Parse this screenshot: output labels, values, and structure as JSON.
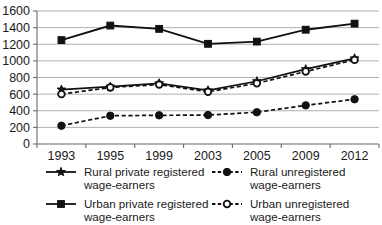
{
  "chart_data": {
    "type": "line",
    "title": "",
    "subtitle": "",
    "xlabel": "",
    "ylabel": "",
    "categories": [
      "1993",
      "1995",
      "1999",
      "2003",
      "2005",
      "2009",
      "2012"
    ],
    "x_tick_labels": [
      "1993",
      "1995",
      "1999",
      "2003",
      "2005",
      "2009",
      "2012"
    ],
    "y_tick_labels": [
      "0",
      "200",
      "400",
      "600",
      "800",
      "1000",
      "1200",
      "1400",
      "1600"
    ],
    "y_ticks": [
      0,
      200,
      400,
      600,
      800,
      1000,
      1200,
      1400,
      1600
    ],
    "ylim": [
      0,
      1600
    ],
    "grid": "horizontal",
    "legend_position": "bottom",
    "series": [
      {
        "name": "Rural private registered wage-earners",
        "line_style": "solid",
        "marker": "star",
        "color": "#111111",
        "values": [
          655,
          690,
          730,
          645,
          755,
          900,
          1030
        ]
      },
      {
        "name": "Rural unregistered wage-earners",
        "line_style": "dashed",
        "marker": "circle-filled",
        "color": "#111111",
        "values": [
          220,
          340,
          345,
          348,
          382,
          465,
          538
        ]
      },
      {
        "name": "Urban private registered wage-earners",
        "line_style": "solid",
        "marker": "square-filled",
        "color": "#111111",
        "values": [
          1250,
          1425,
          1385,
          1205,
          1232,
          1375,
          1448
        ]
      },
      {
        "name": "Urban unregistered wage-earners",
        "line_style": "dashed",
        "marker": "circle-hollow",
        "color": "#111111",
        "values": [
          600,
          680,
          715,
          628,
          730,
          872,
          1012
        ]
      }
    ]
  },
  "legend": {
    "entries": [
      {
        "label_line1": "Rural private registered",
        "label_line2": "wage-earners",
        "marker": "star",
        "line_style": "solid"
      },
      {
        "label_line1": "Rural unregistered",
        "label_line2": "wage-earners",
        "marker": "circle-filled",
        "line_style": "dashed"
      },
      {
        "label_line1": "Urban private registered",
        "label_line2": "wage-earners",
        "marker": "square-filled",
        "line_style": "solid"
      },
      {
        "label_line1": "Urban unregistered",
        "label_line2": "wage-earners",
        "marker": "circle-hollow",
        "line_style": "dashed"
      }
    ]
  }
}
